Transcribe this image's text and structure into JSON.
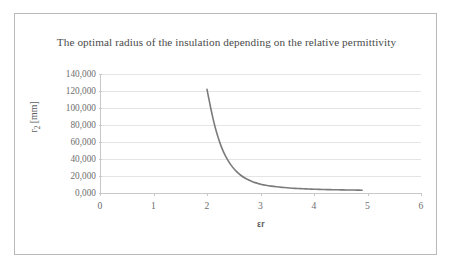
{
  "figure": {
    "background": "#ffffff",
    "border_color": "#b9b9b9"
  },
  "chart_data": {
    "type": "line",
    "title": "The optimal radius of the insulation depending on the relative permittivity",
    "xlabel": "εr",
    "ylabel": "r₂ [mm]",
    "ylabel_base": "r",
    "ylabel_sub": "2",
    "ylabel_unit": " [mm]",
    "xlim": [
      0,
      6
    ],
    "ylim": [
      0,
      140000
    ],
    "grid": "horizontal",
    "legend": "none",
    "line_color": "#7b7b7b",
    "line_width": 1.6,
    "decimal_separator": ",",
    "xticks": [
      0,
      1,
      2,
      3,
      4,
      5,
      6
    ],
    "xtick_labels": [
      "0",
      "1",
      "2",
      "3",
      "4",
      "5",
      "6"
    ],
    "yticks": [
      0,
      20000,
      40000,
      60000,
      80000,
      100000,
      120000,
      140000
    ],
    "ytick_labels": [
      "0,000",
      "20,000",
      "40,000",
      "60,000",
      "80,000",
      "100,000",
      "120,000",
      "140,000"
    ],
    "series": [
      {
        "name": "optimal radius",
        "x": [
          2.0,
          2.05,
          2.1,
          2.15,
          2.2,
          2.25,
          2.3,
          2.35,
          2.4,
          2.45,
          2.5,
          2.55,
          2.6,
          2.65,
          2.7,
          2.75,
          2.8,
          2.85,
          2.9,
          2.95,
          3.0,
          3.1,
          3.2,
          3.3,
          3.4,
          3.5,
          3.6,
          3.7,
          3.8,
          3.9,
          4.0,
          4.1,
          4.2,
          4.3,
          4.4,
          4.5,
          4.6,
          4.7,
          4.8,
          4.9
        ],
        "y": [
          122000,
          106000,
          91000,
          78000,
          67000,
          57500,
          49500,
          43000,
          37500,
          32800,
          28800,
          25400,
          22500,
          20000,
          17900,
          16100,
          14600,
          13300,
          12200,
          11250,
          10400,
          9100,
          8100,
          7300,
          6650,
          6100,
          5650,
          5250,
          4950,
          4700,
          4450,
          4250,
          4080,
          3930,
          3800,
          3680,
          3580,
          3480,
          3400,
          3300
        ]
      }
    ]
  }
}
